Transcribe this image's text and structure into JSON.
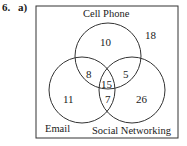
{
  "question": {
    "number": "6.",
    "part": "a)"
  },
  "diagram": {
    "type": "venn-3",
    "sets": [
      "Cell Phone",
      "Email",
      "Social Networking"
    ],
    "regions": {
      "cell_only": "10",
      "email_only": "11",
      "social_only": "26",
      "cell_email": "8",
      "cell_social": "5",
      "email_social": "7",
      "all_three": "15",
      "outside": "18"
    }
  }
}
